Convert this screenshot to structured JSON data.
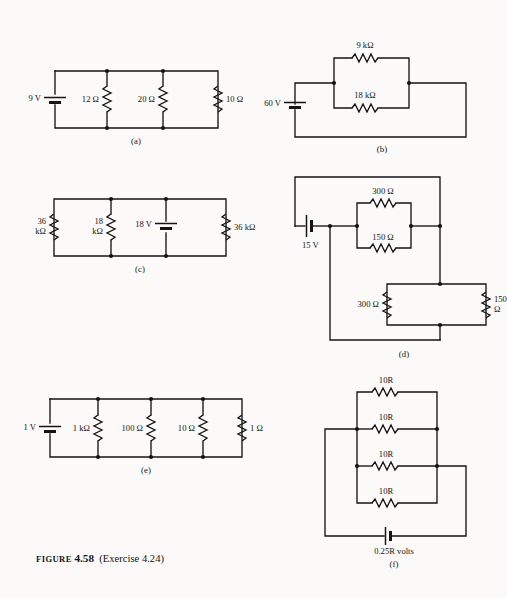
{
  "figure": {
    "label_word": "FIGURE",
    "number": "4.58",
    "exercise": "(Exercise 4.24)"
  },
  "circuits": [
    {
      "id": "a",
      "sublabel": "(a)",
      "source": {
        "name": "battery",
        "value": "9 V",
        "orientation": "vertical"
      },
      "resistors": [
        {
          "value": "12 Ω",
          "orientation": "vertical"
        },
        {
          "value": "20 Ω",
          "orientation": "vertical"
        },
        {
          "value": "10 Ω",
          "orientation": "vertical"
        }
      ]
    },
    {
      "id": "b",
      "sublabel": "(b)",
      "source": {
        "name": "battery",
        "value": "60 V",
        "orientation": "vertical"
      },
      "resistors": [
        {
          "value": "9 kΩ",
          "orientation": "horizontal"
        },
        {
          "value": "18 kΩ",
          "orientation": "horizontal"
        }
      ]
    },
    {
      "id": "c",
      "sublabel": "(c)",
      "source": {
        "name": "battery",
        "value": "18 V",
        "orientation": "vertical"
      },
      "resistors": [
        {
          "value_line1": "36",
          "value_line2": "kΩ",
          "orientation": "vertical"
        },
        {
          "value_line1": "18",
          "value_line2": "kΩ",
          "orientation": "vertical"
        },
        {
          "value": "36 kΩ",
          "orientation": "vertical"
        }
      ]
    },
    {
      "id": "d",
      "sublabel": "(d)",
      "source": {
        "name": "battery",
        "value": "15 V",
        "orientation": "horizontal"
      },
      "resistors": [
        {
          "value": "300 Ω",
          "orientation": "horizontal"
        },
        {
          "value": "150 Ω",
          "orientation": "horizontal"
        },
        {
          "value": "300 Ω",
          "orientation": "vertical"
        },
        {
          "value_line1": "150",
          "value_line2": "Ω",
          "orientation": "vertical"
        }
      ]
    },
    {
      "id": "e",
      "sublabel": "(e)",
      "source": {
        "name": "battery",
        "value": "1 V",
        "orientation": "vertical"
      },
      "resistors": [
        {
          "value": "1 kΩ",
          "orientation": "vertical"
        },
        {
          "value": "100 Ω",
          "orientation": "vertical"
        },
        {
          "value": "10 Ω",
          "orientation": "vertical"
        },
        {
          "value": "1 Ω",
          "orientation": "vertical"
        }
      ]
    },
    {
      "id": "f",
      "sublabel": "(f)",
      "source": {
        "name": "battery",
        "value_prefix": "0.25",
        "value_italic": "R",
        "value_suffix": " volts",
        "orientation": "horizontal"
      },
      "resistors": [
        {
          "value_prefix": "10",
          "value_italic": "R",
          "orientation": "horizontal"
        },
        {
          "value_prefix": "10",
          "value_italic": "R",
          "orientation": "horizontal"
        },
        {
          "value_prefix": "10",
          "value_italic": "R",
          "orientation": "horizontal"
        },
        {
          "value_prefix": "10",
          "value_italic": "R",
          "orientation": "horizontal"
        }
      ]
    }
  ],
  "colors": {
    "ink": "#141414",
    "paper": "#fbfaf8"
  }
}
